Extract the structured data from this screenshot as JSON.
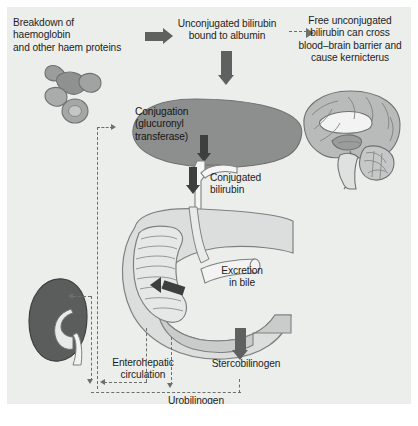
{
  "figure": {
    "background_color": "#eceeec",
    "text_color": "#1d1d1d",
    "arrow_color": "#5e6160",
    "arrow_dark_color": "#3d3f3e",
    "dashed_color": "#6d6f6e",
    "organ_liver_color": "#8c8f8e",
    "organ_kidney_color": "#5b5d5c",
    "organ_pale_color": "#dcdedd"
  },
  "labels": {
    "breakdown": "Breakdown of\nhaemoglobin\nand other haem proteins",
    "unconjugated": "Unconjugated bilirubin\nbound to albumin",
    "kernicterus": "Free unconjugated\nbilirubin can cross\nblood–brain barrier and\ncause kernicterus",
    "conjugation": "Conjugation\n(glucuronyl\ntransferase)",
    "conjugated_bilirubin": "Conjugated\nbilirubin",
    "excretion": "Excretion\nin bile",
    "enterohepatic": "Enterohepatic\ncirculation",
    "stercobilinogen": "Stercobilinogen",
    "urobilinogen": "Urobilinogen"
  },
  "organs": [
    {
      "name": "red-blood-cells",
      "label": "Breakdown of haemoglobin and other haem proteins"
    },
    {
      "name": "liver",
      "label": "Conjugation (glucuronyl transferase)"
    },
    {
      "name": "brain",
      "label": "Free unconjugated bilirubin can cross blood–brain barrier and cause kernicterus"
    },
    {
      "name": "kidney",
      "label": "Enterohepatic circulation / Urobilinogen"
    },
    {
      "name": "duodenum-intestine",
      "label": "Excretion in bile"
    }
  ],
  "arrows": [
    {
      "name": "arrow-breakdown-to-unconjugated",
      "style": "solid",
      "direction": "right"
    },
    {
      "name": "arrow-unconjugated-to-liver",
      "style": "solid",
      "direction": "down"
    },
    {
      "name": "arrow-unconjugated-to-kernicterus",
      "style": "dashed",
      "direction": "right"
    },
    {
      "name": "arrow-conjugation-to-duct",
      "style": "solid",
      "direction": "down"
    },
    {
      "name": "arrow-conjugated-bilirubin-down",
      "style": "solid",
      "direction": "down"
    },
    {
      "name": "arrow-excretion-in-bile",
      "style": "solid",
      "direction": "left"
    },
    {
      "name": "arrow-stercobilinogen-down",
      "style": "solid",
      "direction": "down"
    },
    {
      "name": "arrow-enterohepatic-return",
      "style": "dashed",
      "direction": "left"
    },
    {
      "name": "arrow-urobilinogen-down",
      "style": "dashed",
      "direction": "down"
    },
    {
      "name": "arrow-kidney-inflow",
      "style": "dashed",
      "direction": "left"
    }
  ]
}
